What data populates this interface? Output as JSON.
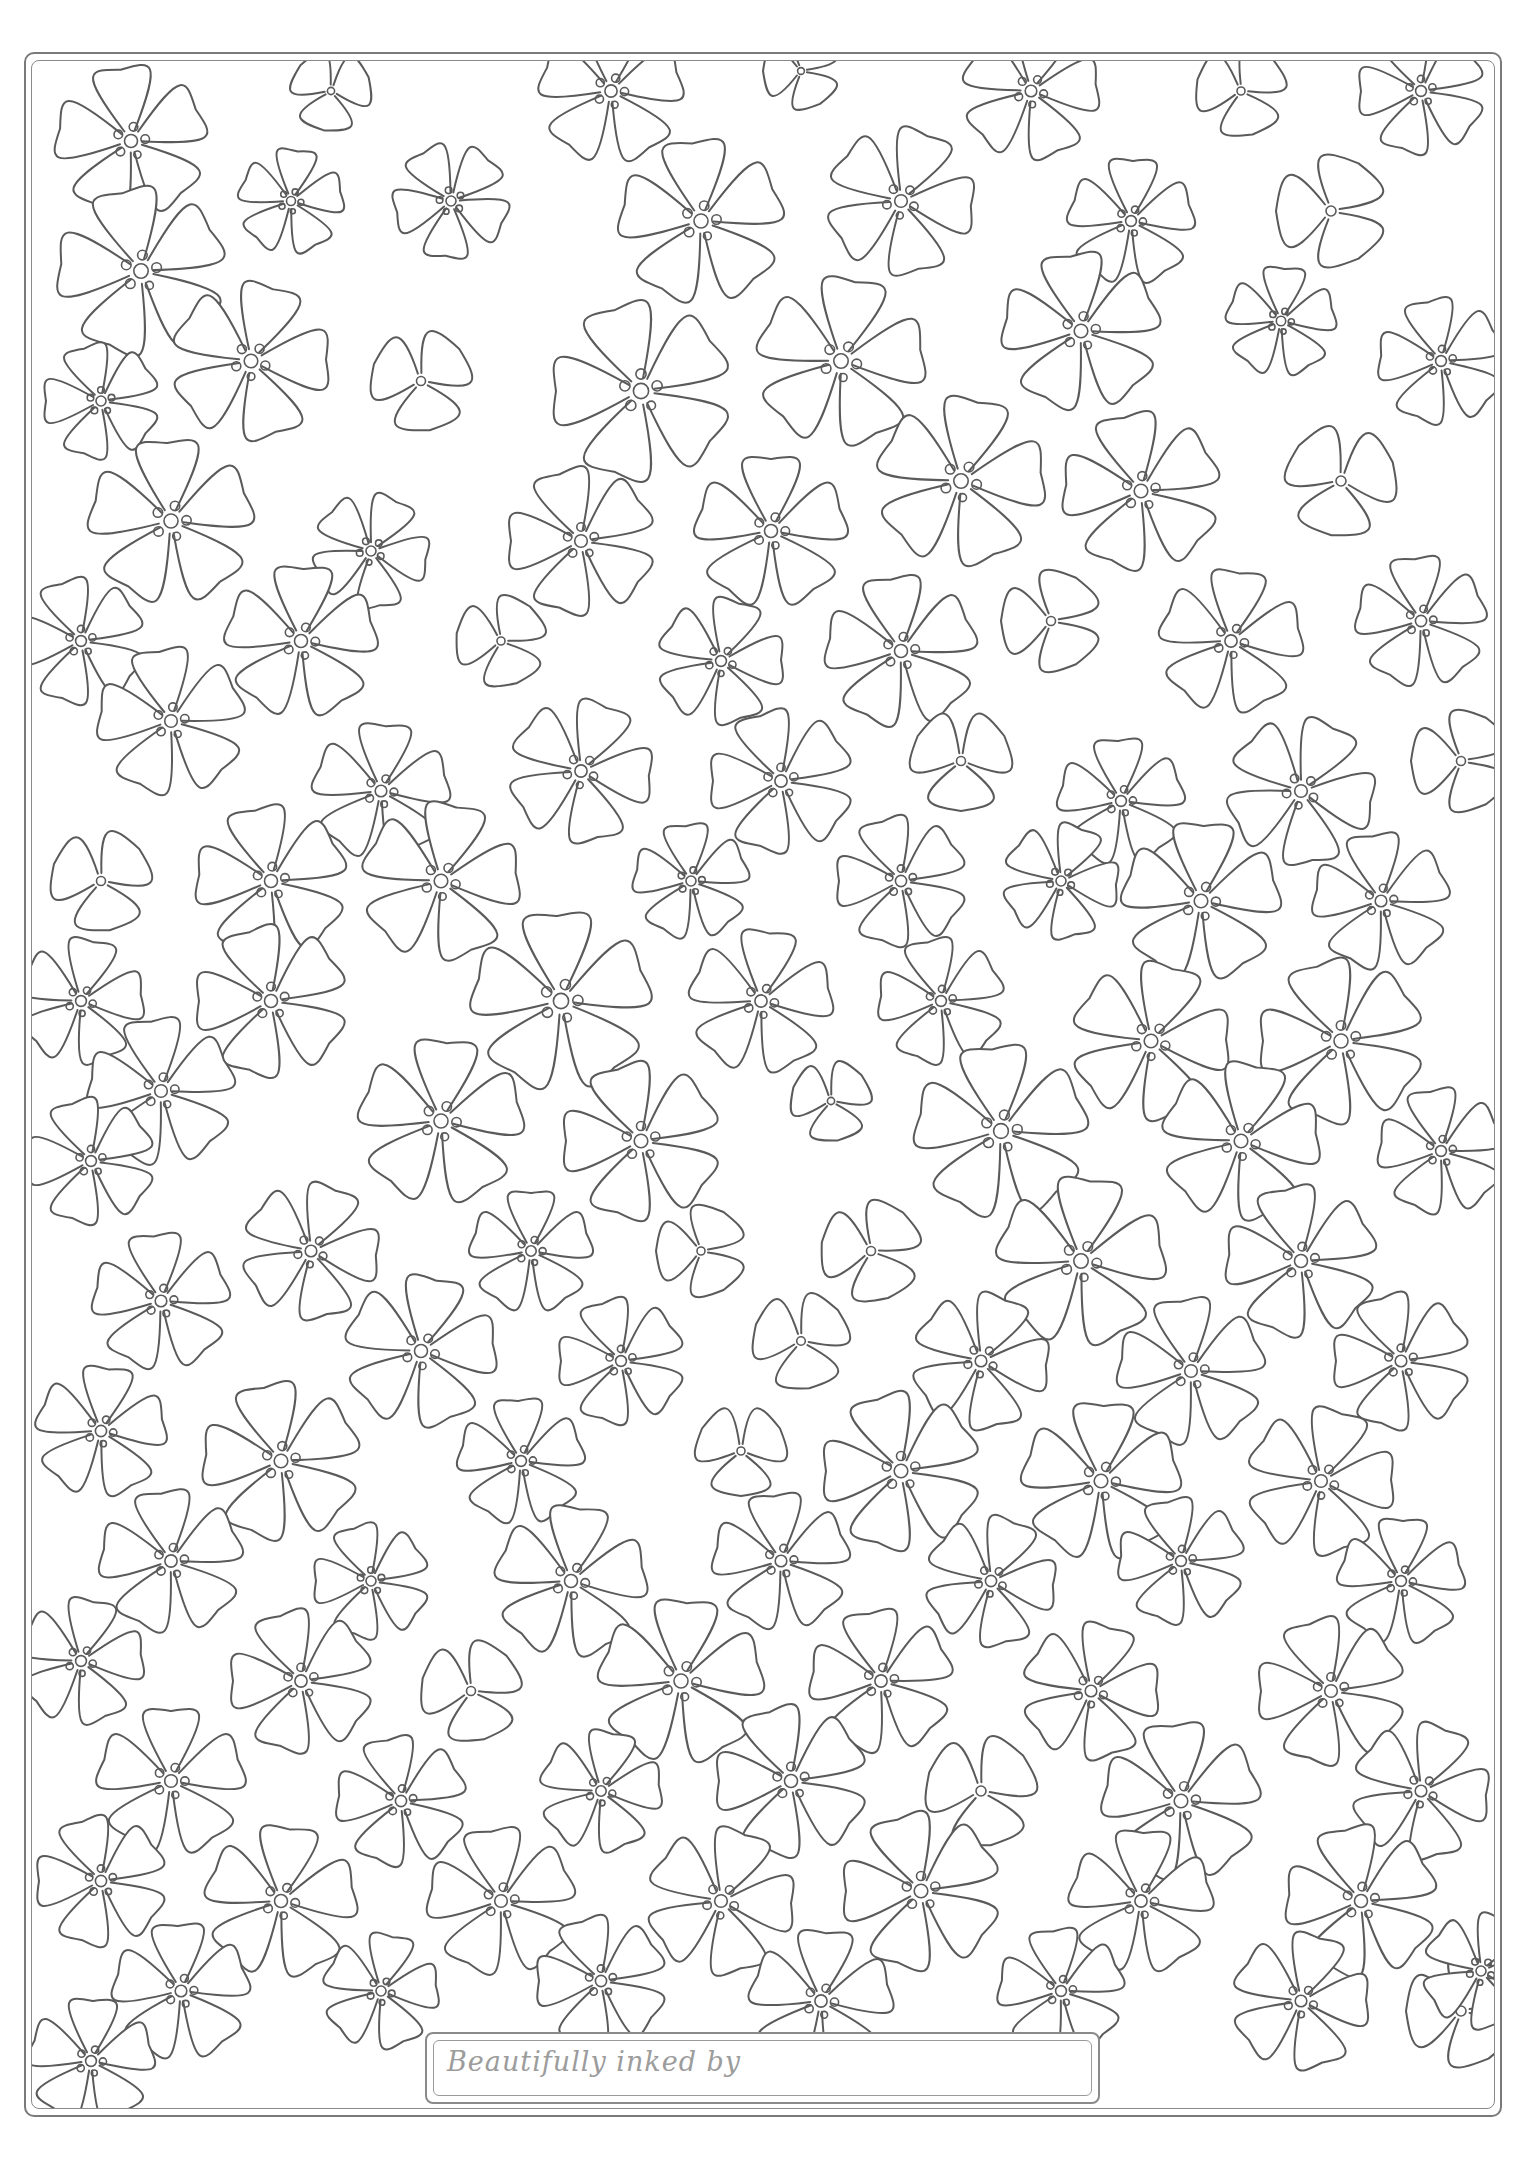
{
  "page": {
    "background": "#ffffff",
    "line_color": "#5a5a5a"
  },
  "label": {
    "text": "Beautifully inked by",
    "value": ""
  },
  "pattern": {
    "motif": "five-petal and three-petal outline flowers with dotted centres",
    "flowers": [
      [
        130,
        140,
        72,
        5,
        10
      ],
      [
        330,
        90,
        40,
        3,
        40
      ],
      [
        610,
        90,
        68,
        5,
        20
      ],
      [
        800,
        70,
        38,
        3,
        0
      ],
      [
        1030,
        90,
        65,
        5,
        30
      ],
      [
        1240,
        90,
        45,
        3,
        15
      ],
      [
        1420,
        90,
        60,
        5,
        0
      ],
      [
        140,
        270,
        80,
        5,
        5
      ],
      [
        290,
        200,
        50,
        5,
        25
      ],
      [
        450,
        200,
        55,
        5,
        60
      ],
      [
        700,
        220,
        78,
        5,
        12
      ],
      [
        900,
        200,
        70,
        5,
        40
      ],
      [
        1130,
        220,
        60,
        5,
        20
      ],
      [
        1330,
        210,
        55,
        3,
        0
      ],
      [
        250,
        360,
        75,
        5,
        35
      ],
      [
        100,
        400,
        55,
        5,
        0
      ],
      [
        420,
        380,
        50,
        3,
        20
      ],
      [
        640,
        390,
        85,
        5,
        0
      ],
      [
        840,
        360,
        80,
        5,
        28
      ],
      [
        1080,
        330,
        75,
        5,
        10
      ],
      [
        1280,
        320,
        52,
        5,
        22
      ],
      [
        1440,
        360,
        60,
        5,
        5
      ],
      [
        170,
        520,
        78,
        5,
        15
      ],
      [
        370,
        550,
        55,
        5,
        45
      ],
      [
        580,
        540,
        70,
        5,
        0
      ],
      [
        770,
        530,
        72,
        5,
        18
      ],
      [
        960,
        480,
        80,
        5,
        30
      ],
      [
        1140,
        490,
        75,
        5,
        5
      ],
      [
        1340,
        480,
        55,
        3,
        40
      ],
      [
        80,
        640,
        60,
        5,
        0
      ],
      [
        300,
        640,
        72,
        5,
        20
      ],
      [
        500,
        640,
        45,
        3,
        10
      ],
      [
        720,
        660,
        60,
        5,
        35
      ],
      [
        900,
        650,
        72,
        5,
        10
      ],
      [
        1050,
        620,
        50,
        3,
        0
      ],
      [
        1230,
        640,
        68,
        5,
        25
      ],
      [
        1420,
        620,
        62,
        5,
        12
      ],
      [
        170,
        720,
        70,
        5,
        8
      ],
      [
        380,
        790,
        65,
        5,
        22
      ],
      [
        580,
        770,
        68,
        5,
        40
      ],
      [
        780,
        780,
        68,
        5,
        0
      ],
      [
        960,
        760,
        50,
        3,
        30
      ],
      [
        1120,
        800,
        60,
        5,
        15
      ],
      [
        1300,
        790,
        70,
        5,
        45
      ],
      [
        1460,
        760,
        50,
        3,
        0
      ],
      [
        100,
        880,
        50,
        3,
        20
      ],
      [
        270,
        880,
        72,
        5,
        5
      ],
      [
        440,
        880,
        75,
        5,
        30
      ],
      [
        690,
        880,
        55,
        5,
        12
      ],
      [
        900,
        880,
        62,
        5,
        0
      ],
      [
        1060,
        880,
        55,
        5,
        40
      ],
      [
        1200,
        900,
        75,
        5,
        20
      ],
      [
        1380,
        900,
        65,
        5,
        10
      ],
      [
        80,
        1000,
        60,
        5,
        30
      ],
      [
        270,
        1000,
        72,
        5,
        0
      ],
      [
        560,
        1000,
        85,
        5,
        15
      ],
      [
        760,
        1000,
        68,
        5,
        25
      ],
      [
        940,
        1000,
        60,
        5,
        5
      ],
      [
        1150,
        1040,
        75,
        5,
        35
      ],
      [
        1340,
        1040,
        78,
        5,
        0
      ],
      [
        160,
        1090,
        70,
        5,
        10
      ],
      [
        440,
        1120,
        78,
        5,
        22
      ],
      [
        640,
        1140,
        75,
        5,
        0
      ],
      [
        830,
        1100,
        40,
        3,
        20
      ],
      [
        1000,
        1130,
        82,
        5,
        12
      ],
      [
        1240,
        1140,
        75,
        5,
        30
      ],
      [
        1440,
        1150,
        60,
        5,
        8
      ],
      [
        90,
        1160,
        60,
        5,
        0
      ],
      [
        310,
        1250,
        65,
        5,
        40
      ],
      [
        530,
        1250,
        58,
        5,
        18
      ],
      [
        700,
        1250,
        45,
        3,
        0
      ],
      [
        870,
        1250,
        50,
        3,
        10
      ],
      [
        1080,
        1260,
        80,
        5,
        25
      ],
      [
        1300,
        1260,
        72,
        5,
        5
      ],
      [
        160,
        1300,
        65,
        5,
        12
      ],
      [
        420,
        1350,
        72,
        5,
        30
      ],
      [
        620,
        1360,
        60,
        5,
        0
      ],
      [
        800,
        1340,
        48,
        3,
        20
      ],
      [
        980,
        1360,
        65,
        5,
        40
      ],
      [
        1190,
        1370,
        70,
        5,
        10
      ],
      [
        1400,
        1360,
        65,
        5,
        0
      ],
      [
        100,
        1430,
        62,
        5,
        25
      ],
      [
        280,
        1460,
        75,
        5,
        5
      ],
      [
        520,
        1460,
        60,
        5,
        15
      ],
      [
        740,
        1450,
        45,
        3,
        30
      ],
      [
        900,
        1470,
        75,
        5,
        0
      ],
      [
        1100,
        1480,
        75,
        5,
        20
      ],
      [
        1320,
        1480,
        70,
        5,
        35
      ],
      [
        170,
        1560,
        68,
        5,
        10
      ],
      [
        370,
        1580,
        55,
        5,
        0
      ],
      [
        570,
        1580,
        72,
        5,
        25
      ],
      [
        780,
        1560,
        65,
        5,
        12
      ],
      [
        990,
        1580,
        62,
        5,
        40
      ],
      [
        1180,
        1560,
        60,
        5,
        5
      ],
      [
        1400,
        1580,
        60,
        5,
        20
      ],
      [
        80,
        1660,
        60,
        5,
        30
      ],
      [
        300,
        1680,
        68,
        5,
        0
      ],
      [
        470,
        1690,
        50,
        3,
        15
      ],
      [
        680,
        1680,
        78,
        5,
        22
      ],
      [
        880,
        1680,
        68,
        5,
        8
      ],
      [
        1090,
        1690,
        65,
        5,
        35
      ],
      [
        1330,
        1690,
        70,
        5,
        0
      ],
      [
        170,
        1780,
        70,
        5,
        18
      ],
      [
        400,
        1800,
        62,
        5,
        5
      ],
      [
        600,
        1790,
        58,
        5,
        30
      ],
      [
        790,
        1780,
        72,
        5,
        0
      ],
      [
        980,
        1790,
        55,
        3,
        20
      ],
      [
        1180,
        1800,
        75,
        5,
        12
      ],
      [
        1420,
        1790,
        65,
        5,
        40
      ],
      [
        100,
        1880,
        62,
        5,
        0
      ],
      [
        280,
        1900,
        72,
        5,
        25
      ],
      [
        500,
        1900,
        70,
        5,
        10
      ],
      [
        720,
        1900,
        70,
        5,
        38
      ],
      [
        920,
        1890,
        75,
        5,
        0
      ],
      [
        1140,
        1900,
        68,
        5,
        20
      ],
      [
        1360,
        1900,
        72,
        5,
        5
      ],
      [
        180,
        1990,
        65,
        5,
        15
      ],
      [
        380,
        1990,
        55,
        5,
        30
      ],
      [
        600,
        1980,
        62,
        5,
        0
      ],
      [
        820,
        2000,
        68,
        5,
        22
      ],
      [
        1060,
        1990,
        60,
        5,
        10
      ],
      [
        1300,
        2000,
        65,
        5,
        35
      ],
      [
        1460,
        2010,
        55,
        3,
        0
      ],
      [
        90,
        2060,
        60,
        5,
        20
      ],
      [
        1480,
        1970,
        55,
        5,
        40
      ]
    ]
  }
}
